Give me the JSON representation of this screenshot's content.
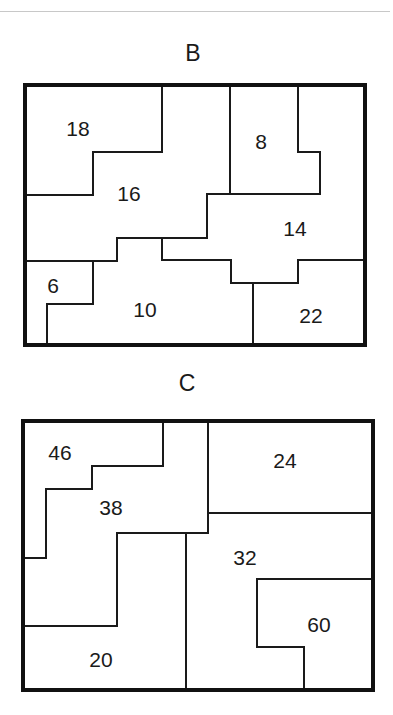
{
  "diagrams": {
    "B": {
      "title": "B",
      "regions": [
        {
          "label": "18",
          "x": 78,
          "y": 136
        },
        {
          "label": "16",
          "x": 129,
          "y": 201
        },
        {
          "label": "8",
          "x": 261,
          "y": 149
        },
        {
          "label": "14",
          "x": 295,
          "y": 236
        },
        {
          "label": "6",
          "x": 53,
          "y": 293
        },
        {
          "label": "10",
          "x": 145,
          "y": 317
        },
        {
          "label": "22",
          "x": 311,
          "y": 323
        }
      ]
    },
    "C": {
      "title": "C",
      "regions": [
        {
          "label": "46",
          "x": 60,
          "y": 460
        },
        {
          "label": "38",
          "x": 111,
          "y": 515
        },
        {
          "label": "24",
          "x": 285,
          "y": 468
        },
        {
          "label": "32",
          "x": 245,
          "y": 565
        },
        {
          "label": "60",
          "x": 319,
          "y": 632
        },
        {
          "label": "20",
          "x": 101,
          "y": 667
        }
      ]
    }
  }
}
